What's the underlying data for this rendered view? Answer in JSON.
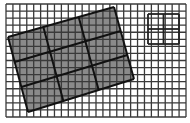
{
  "figure": {
    "title": "",
    "colors": {
      "background": "#ffffff",
      "grid_line": "#3a3a3a",
      "overlay_fill": "#8a8a8a",
      "overlay_line": "#111111",
      "small_square_line": "#222222"
    },
    "base_grid": {
      "x0": 6,
      "y0": 4,
      "x1": 186,
      "y1": 117,
      "cols": 26,
      "rows": 16
    },
    "rotated_square": {
      "corners": [
        [
          8,
          37
        ],
        [
          114,
          7
        ],
        [
          134,
          79
        ],
        [
          28,
          112
        ]
      ],
      "divisions": 3
    },
    "small_square": {
      "x": 148,
      "y": 14,
      "w": 31,
      "h": 30,
      "divisions": 2
    }
  }
}
